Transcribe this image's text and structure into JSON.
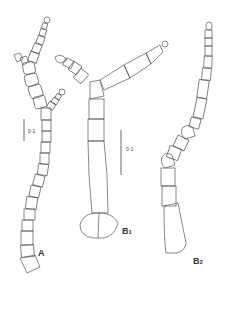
{
  "figure": {
    "panels": [
      {
        "id": "A",
        "label": "A",
        "subscript": ""
      },
      {
        "id": "B1",
        "label": "B",
        "subscript": "1"
      },
      {
        "id": "B2",
        "label": "B",
        "subscript": "2"
      }
    ],
    "scale_bars": [
      {
        "panel": "A",
        "label": "0·1"
      },
      {
        "panel": "B1",
        "label": "0·1"
      }
    ],
    "line_color": "#555555",
    "background": "#ffffff"
  }
}
